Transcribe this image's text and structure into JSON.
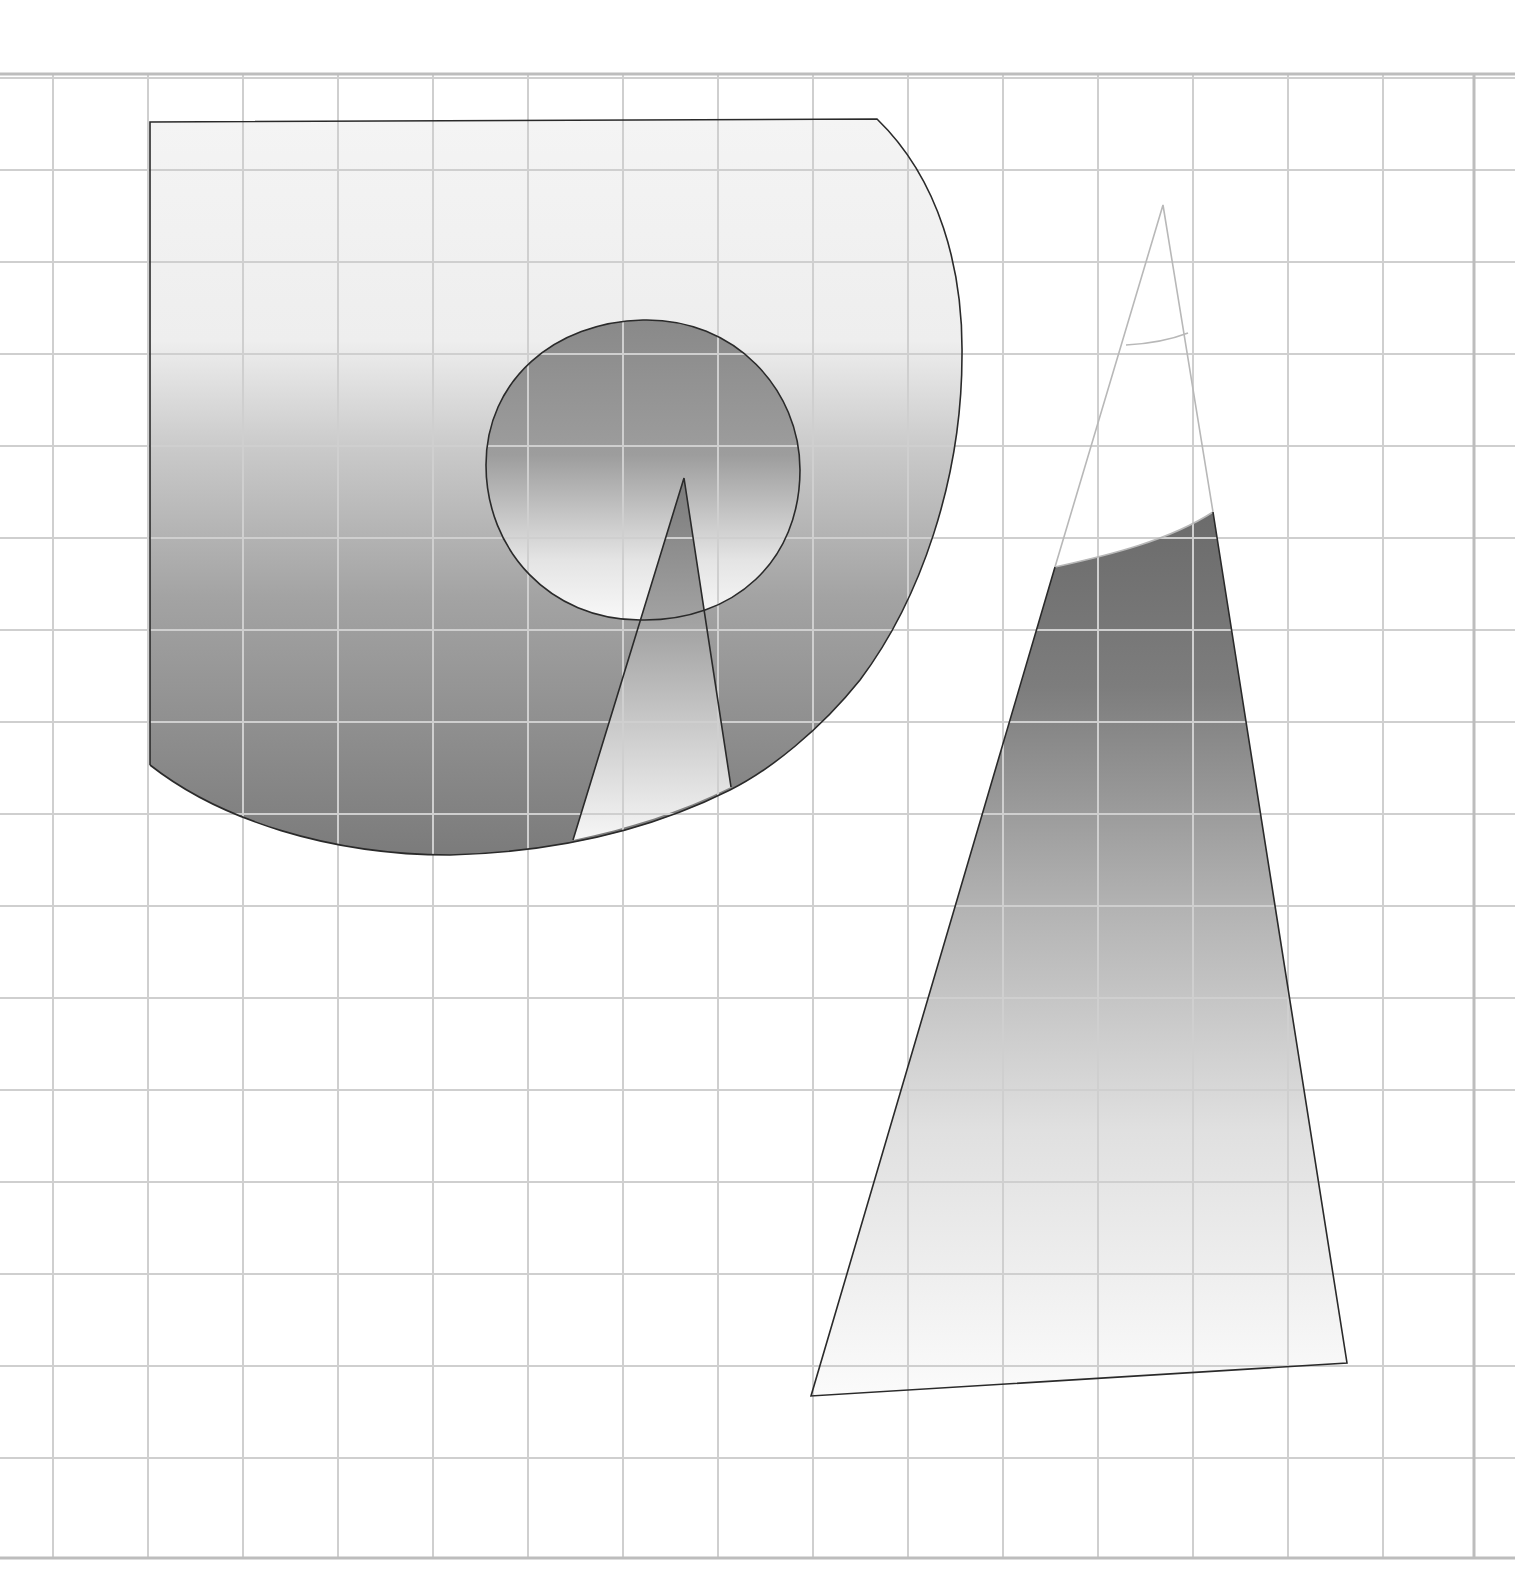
{
  "diagram": {
    "type": "geometric-shapes-on-grid",
    "background": "#ffffff",
    "grid": {
      "color": "#cfcfcf",
      "border_color": "#bdbdbd",
      "vertical_lines_x": [
        53,
        148,
        243,
        338,
        433,
        528,
        623,
        718,
        813,
        908,
        1003,
        1098,
        1193,
        1288,
        1383
      ],
      "right_border_x": 1474,
      "horizontal_lines_y": [
        78,
        170,
        262,
        354,
        446,
        538,
        630,
        722,
        814,
        906,
        998,
        1090,
        1182,
        1274,
        1366,
        1458
      ],
      "top_border_y": 74,
      "bottom_border_y": 1558,
      "cell_size_px": 94
    },
    "shapes": [
      {
        "id": "rounded-sector",
        "description": "Large shape: square top-left corner, flat top edge, right side curving down into an arc that sweeps along the bottom",
        "gradient": [
          "#f4f4f4",
          "#f0f0f0",
          "#c6c6c6",
          "#a2a2a2",
          "#7e7e7e"
        ],
        "outline": "#2a2a2a"
      },
      {
        "id": "inner-circle",
        "description": "Circle inside the large shape, dark top fading to white at the bottom",
        "center": [
          643,
          470
        ],
        "radius_x": 157,
        "radius_y": 150,
        "gradient": [
          "#8a8a8a",
          "#9c9c9c",
          "#f6f6f6"
        ],
        "outline": "#2a2a2a"
      },
      {
        "id": "inner-spike",
        "description": "Narrow triangle spike rising from the bottom arc into the circle",
        "apex": [
          684,
          478
        ],
        "gradient": [
          "#7c7c7c",
          "#bdbdbd",
          "#f5f5f5"
        ],
        "outline": "#2a2a2a"
      },
      {
        "id": "tall-triangle",
        "description": "Tall triangle on the right; its top portion is white (outlined in light gray), lower portion is shaded dark at the cut line fading to white at the base",
        "apex": [
          1163,
          205
        ],
        "base_left": [
          811,
          1396
        ],
        "base_right": [
          1347,
          1363
        ],
        "gradient": [
          "#6a6a6a",
          "#8c8c8c",
          "#c8c8c8",
          "#f2f2f2",
          "#fbfbfb"
        ],
        "outline": "#2a2a2a",
        "upper_outline": "#b8b8b8"
      }
    ]
  }
}
